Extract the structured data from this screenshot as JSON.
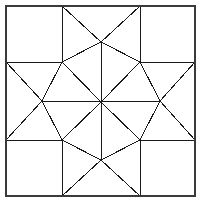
{
  "figure": {
    "width": 202,
    "height": 204,
    "background_color": "#ffffff",
    "line_color": "#1a1a1a",
    "frame_color": "#3a3a3a",
    "line_width": 1
  },
  "geometry": {
    "center": {
      "x": 101,
      "y": 102
    },
    "frame": {
      "left": 6,
      "top": 6,
      "right": 195,
      "bottom": 196
    },
    "grid_x": [
      62,
      140
    ],
    "grid_y": [
      62,
      140
    ],
    "star_tips": {
      "top": {
        "x": 101,
        "y": 42
      },
      "bottom": {
        "x": 101,
        "y": 160
      },
      "left": {
        "x": 42,
        "y": 101
      },
      "right": {
        "x": 160,
        "y": 101
      }
    },
    "frame_corners": {
      "top_left": {
        "x": 6,
        "y": 6
      },
      "top_right": {
        "x": 195,
        "y": 6
      },
      "bottom_left": {
        "x": 6,
        "y": 196
      },
      "bottom_right": {
        "x": 195,
        "y": 196
      }
    }
  },
  "patches": [
    {
      "name": "corner-square-top-left",
      "kind": "square",
      "points": "6,6 62,6 62,62 6,62"
    },
    {
      "name": "corner-square-top-right",
      "kind": "square",
      "points": "140,6 195,6 195,62 140,62"
    },
    {
      "name": "corner-square-bottom-left",
      "kind": "square",
      "points": "6,140 62,140 62,196 6,196"
    },
    {
      "name": "corner-square-bottom-right",
      "kind": "square",
      "points": "140,140 195,140 195,196 140,196"
    },
    {
      "name": "edge-triangle-top-left",
      "kind": "triangle",
      "points": "62,6 101,42 62,62"
    },
    {
      "name": "edge-triangle-top-right",
      "kind": "triangle",
      "points": "140,6 140,62 101,42"
    },
    {
      "name": "edge-triangle-bottom-left",
      "kind": "triangle",
      "points": "62,196 62,140 101,160"
    },
    {
      "name": "edge-triangle-bottom-right",
      "kind": "triangle",
      "points": "140,196 101,160 140,140"
    },
    {
      "name": "edge-triangle-left-top",
      "kind": "triangle",
      "points": "6,62 62,62 42,101"
    },
    {
      "name": "edge-triangle-left-bottom",
      "kind": "triangle",
      "points": "6,140 42,101 62,140"
    },
    {
      "name": "edge-triangle-right-top",
      "kind": "triangle",
      "points": "195,62 160,101 140,62"
    },
    {
      "name": "edge-triangle-right-bottom",
      "kind": "triangle",
      "points": "195,140 140,140 160,101"
    },
    {
      "name": "star-diamond-n-left",
      "kind": "diamond",
      "points": "101,102 62,62 101,42"
    },
    {
      "name": "star-diamond-n-right",
      "kind": "diamond",
      "points": "101,102 101,42 140,62"
    },
    {
      "name": "star-diamond-e-upper",
      "kind": "diamond",
      "points": "101,102 140,62 160,101"
    },
    {
      "name": "star-diamond-e-lower",
      "kind": "diamond",
      "points": "101,102 160,101 140,140"
    },
    {
      "name": "star-diamond-s-right",
      "kind": "diamond",
      "points": "101,102 140,140 101,160"
    },
    {
      "name": "star-diamond-s-left",
      "kind": "diamond",
      "points": "101,102 101,160 62,140"
    },
    {
      "name": "star-diamond-w-lower",
      "kind": "diamond",
      "points": "101,102 62,140 42,101"
    },
    {
      "name": "star-diamond-w-upper",
      "kind": "diamond",
      "points": "101,102 42,101 62,62"
    }
  ],
  "outline": {
    "name": "block-frame",
    "points": "6,6 195,6 195,196 6,196"
  }
}
